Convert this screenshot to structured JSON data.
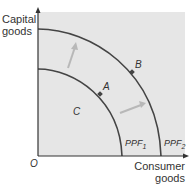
{
  "diagram": {
    "type": "production-possibility-frontier",
    "y_axis_label_line1": "Capital",
    "y_axis_label_line2": "goods",
    "x_axis_label_line1": "Consumer",
    "x_axis_label_line2": "goods",
    "origin_label": "O",
    "curves": [
      {
        "name": "PPF",
        "subscript": "1"
      },
      {
        "name": "PPF",
        "subscript": "2"
      }
    ],
    "points": {
      "A": "A",
      "B": "B",
      "C": "C"
    },
    "arrows": [
      "outward shift upward",
      "outward shift rightward"
    ],
    "colors": {
      "background": "#e6e6e6",
      "curve": "#444444",
      "axis": "#333333",
      "arrow": "#b5b5b5",
      "point": "#444444"
    }
  }
}
